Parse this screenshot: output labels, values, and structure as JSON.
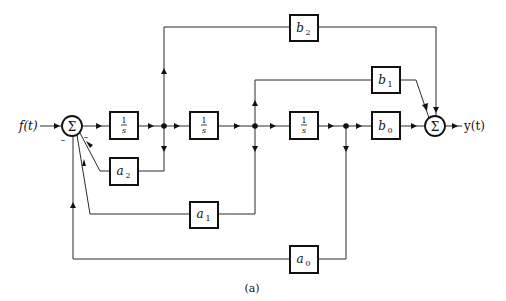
{
  "diagram": {
    "input_label": "f(t)",
    "output_label": "y(t)",
    "caption": "(a)",
    "summing_junction_symbol": "Σ",
    "minus_sign": "–",
    "integrators": [
      {
        "id": "int1",
        "num": "1",
        "den": "s"
      },
      {
        "id": "int2",
        "num": "1",
        "den": "s"
      },
      {
        "id": "int3",
        "num": "1",
        "den": "s"
      }
    ],
    "feedback_gains": [
      {
        "id": "a2",
        "base": "a",
        "sub": "2"
      },
      {
        "id": "a1",
        "base": "a",
        "sub": "1"
      },
      {
        "id": "a0",
        "base": "a",
        "sub": "0"
      }
    ],
    "feedforward_gains": [
      {
        "id": "b2",
        "base": "b",
        "sub": "2"
      },
      {
        "id": "b1",
        "base": "b",
        "sub": "1"
      },
      {
        "id": "b0",
        "base": "b",
        "sub": "0"
      }
    ]
  }
}
